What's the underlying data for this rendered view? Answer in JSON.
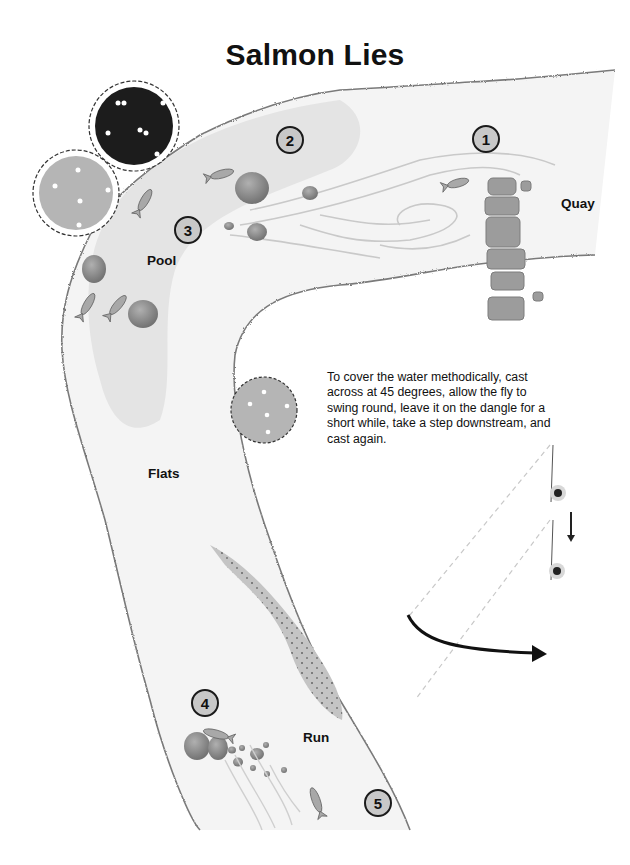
{
  "title": "Salmon Lies",
  "locations": {
    "quay": "Quay",
    "pool": "Pool",
    "flats": "Flats",
    "run": "Run"
  },
  "lies": [
    {
      "number": "1"
    },
    {
      "number": "2"
    },
    {
      "number": "3"
    },
    {
      "number": "4"
    },
    {
      "number": "5"
    }
  ],
  "instructions": "To cover the water methodically, cast across at 45 degrees, allow the fly to swing round, leave it on the dangle for a short while, take a step downstream, and cast again.",
  "colors": {
    "water": "#f4f4f4",
    "deep_water": "#e2e2e2",
    "bank": "#7a7a7a",
    "rock": "#8a8a8a",
    "tree_dark": "#1c1c1c",
    "tree_light": "#b5b5b5",
    "gravel": "#c4c4c4",
    "badge": "#c8c8c8"
  }
}
